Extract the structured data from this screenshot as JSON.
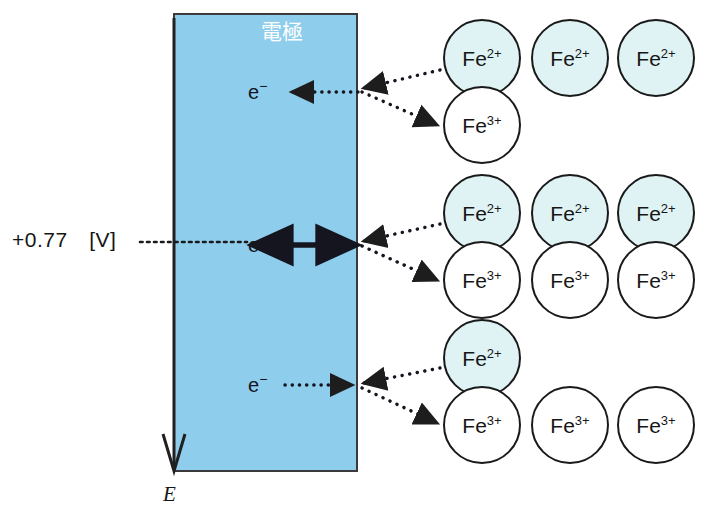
{
  "figure": {
    "electrode": {
      "title": "電極",
      "fill_color": "#8ecdec",
      "border_color": "#3a3a3a"
    },
    "axis": {
      "label": "E",
      "direction": "down"
    },
    "voltage": {
      "label": "+0.77　[V]"
    },
    "electron_labels": [
      {
        "text": "e",
        "charge": "−",
        "row": "top"
      },
      {
        "text": "e",
        "charge": "−",
        "row": "middle"
      },
      {
        "text": "e",
        "charge": "−",
        "row": "bottom"
      }
    ],
    "ion_colors": {
      "fe2_fill": "#dff2f4",
      "fe3_fill": "#ffffff",
      "outline": "#1a1a1a"
    },
    "rows": [
      {
        "name": "top-row",
        "fe2": [
          {
            "species": "Fe",
            "charge": "2+",
            "cx": 482,
            "cy": 58
          },
          {
            "species": "Fe",
            "charge": "2+",
            "cx": 570,
            "cy": 58
          },
          {
            "species": "Fe",
            "charge": "2+",
            "cx": 656,
            "cy": 58
          }
        ],
        "fe3": [
          {
            "species": "Fe",
            "charge": "3+",
            "cx": 482,
            "cy": 125
          }
        ]
      },
      {
        "name": "middle-row",
        "fe2": [
          {
            "species": "Fe",
            "charge": "2+",
            "cx": 482,
            "cy": 213
          },
          {
            "species": "Fe",
            "charge": "2+",
            "cx": 570,
            "cy": 213
          },
          {
            "species": "Fe",
            "charge": "2+",
            "cx": 656,
            "cy": 213
          }
        ],
        "fe3": [
          {
            "species": "Fe",
            "charge": "3+",
            "cx": 482,
            "cy": 280
          },
          {
            "species": "Fe",
            "charge": "3+",
            "cx": 570,
            "cy": 280
          },
          {
            "species": "Fe",
            "charge": "3+",
            "cx": 656,
            "cy": 280
          }
        ]
      },
      {
        "name": "bottom-row",
        "fe2": [
          {
            "species": "Fe",
            "charge": "2+",
            "cx": 482,
            "cy": 358
          }
        ],
        "fe3": [
          {
            "species": "Fe",
            "charge": "3+",
            "cx": 482,
            "cy": 425
          },
          {
            "species": "Fe",
            "charge": "3+",
            "cx": 570,
            "cy": 425
          },
          {
            "species": "Fe",
            "charge": "3+",
            "cx": 656,
            "cy": 425
          }
        ]
      }
    ]
  }
}
